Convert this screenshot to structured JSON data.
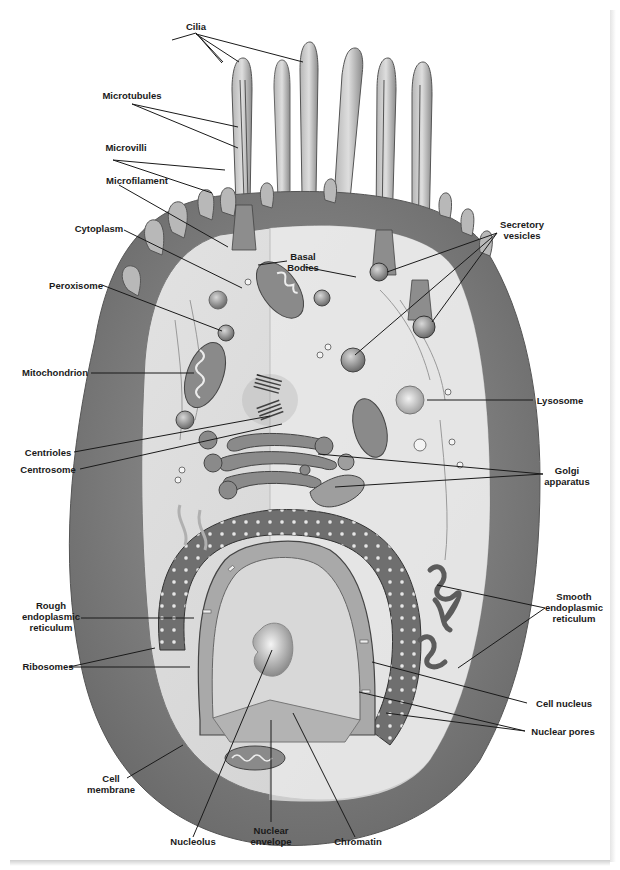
{
  "figure": {
    "palette": {
      "background": "#ffffff",
      "membrane": "#8a8a8a",
      "membrane_dark": "#6e6e6e",
      "cytoplasm": "#d9d9d9",
      "cytoplasm_light": "#e8e8e8",
      "organelle": "#9a9a9a",
      "organelle_dark": "#555555",
      "nucleus": "#c4c4c4",
      "nucleoplasm": "#dadada",
      "text": "#1a1a1a"
    }
  },
  "labels": {
    "cilia": "Cilia",
    "microtubules": "Microtubules",
    "microvilli": "Microvilli",
    "microfilament": "Microfilament",
    "cytoplasm": "Cytoplasm",
    "basal_bodies": [
      "Basal",
      "Bodies"
    ],
    "secretory_vesicles": [
      "Secretory",
      "vesicles"
    ],
    "peroxisome": "Peroxisome",
    "mitochondrion": "Mitochondrion",
    "lysosome": "Lysosome",
    "centrioles": "Centrioles",
    "centrosome": "Centrosome",
    "golgi_apparatus": [
      "Golgi",
      "apparatus"
    ],
    "rough_er": [
      "Rough",
      "endoplasmic",
      "reticulum"
    ],
    "smooth_er": [
      "Smooth",
      "endoplasmic",
      "reticulum"
    ],
    "ribosomes": "Ribosomes",
    "cell_nucleus": "Cell nucleus",
    "nuclear_pores": "Nuclear pores",
    "cell_membrane": [
      "Cell",
      "membrane"
    ],
    "nucleolus": "Nucleolus",
    "nuclear_envelope": [
      "Nuclear",
      "envelope"
    ],
    "chromatin": "Chromatin"
  }
}
